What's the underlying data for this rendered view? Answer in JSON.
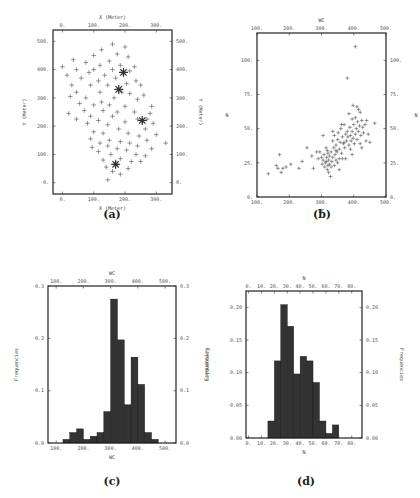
{
  "chart_data": [
    {
      "panel": "a",
      "type": "scatter",
      "caption": "(a)",
      "title": "",
      "xlabel": "X (Meter)",
      "ylabel": "Y (Meter)",
      "xticks": [
        "0.",
        "100.",
        "200.",
        "300."
      ],
      "yticks": [
        "0.",
        "100.",
        "200.",
        "300.",
        "400.",
        "500."
      ],
      "xlim": [
        -30,
        350
      ],
      "ylim": [
        -40,
        540
      ],
      "grid": false,
      "highlighted_points": [
        [
          195,
          390
        ],
        [
          180,
          330
        ],
        [
          255,
          220
        ],
        [
          170,
          65
        ]
      ],
      "points": [
        [
          160,
          490
        ],
        [
          200,
          480
        ],
        [
          125,
          470
        ],
        [
          100,
          450
        ],
        [
          175,
          455
        ],
        [
          210,
          445
        ],
        [
          35,
          435
        ],
        [
          75,
          425
        ],
        [
          150,
          430
        ],
        [
          120,
          415
        ],
        [
          185,
          415
        ],
        [
          230,
          410
        ],
        [
          0,
          410
        ],
        [
          45,
          400
        ],
        [
          100,
          400
        ],
        [
          160,
          400
        ],
        [
          215,
          395
        ],
        [
          15,
          380
        ],
        [
          85,
          390
        ],
        [
          135,
          380
        ],
        [
          60,
          370
        ],
        [
          115,
          360
        ],
        [
          170,
          370
        ],
        [
          235,
          360
        ],
        [
          30,
          345
        ],
        [
          90,
          345
        ],
        [
          145,
          345
        ],
        [
          205,
          350
        ],
        [
          250,
          345
        ],
        [
          45,
          320
        ],
        [
          120,
          320
        ],
        [
          190,
          320
        ],
        [
          215,
          315
        ],
        [
          260,
          310
        ],
        [
          25,
          305
        ],
        [
          75,
          300
        ],
        [
          165,
          300
        ],
        [
          240,
          295
        ],
        [
          125,
          285
        ],
        [
          55,
          280
        ],
        [
          100,
          275
        ],
        [
          150,
          275
        ],
        [
          200,
          270
        ],
        [
          285,
          270
        ],
        [
          70,
          255
        ],
        [
          130,
          255
        ],
        [
          175,
          250
        ],
        [
          230,
          250
        ],
        [
          280,
          245
        ],
        [
          20,
          245
        ],
        [
          90,
          235
        ],
        [
          160,
          235
        ],
        [
          270,
          225
        ],
        [
          45,
          225
        ],
        [
          115,
          220
        ],
        [
          200,
          215
        ],
        [
          240,
          225
        ],
        [
          290,
          210
        ],
        [
          80,
          210
        ],
        [
          145,
          205
        ],
        [
          180,
          190
        ],
        [
          265,
          190
        ],
        [
          100,
          180
        ],
        [
          130,
          175
        ],
        [
          210,
          175
        ],
        [
          245,
          165
        ],
        [
          300,
          170
        ],
        [
          90,
          155
        ],
        [
          150,
          150
        ],
        [
          185,
          145
        ],
        [
          270,
          150
        ],
        [
          120,
          140
        ],
        [
          215,
          140
        ],
        [
          330,
          140
        ],
        [
          145,
          130
        ],
        [
          240,
          130
        ],
        [
          95,
          125
        ],
        [
          175,
          120
        ],
        [
          205,
          115
        ],
        [
          285,
          120
        ],
        [
          115,
          110
        ],
        [
          155,
          100
        ],
        [
          235,
          100
        ],
        [
          265,
          95
        ],
        [
          185,
          85
        ],
        [
          130,
          80
        ],
        [
          220,
          75
        ],
        [
          250,
          75
        ],
        [
          140,
          55
        ],
        [
          210,
          50
        ],
        [
          160,
          40
        ],
        [
          185,
          30
        ],
        [
          145,
          10
        ]
      ]
    },
    {
      "panel": "b",
      "type": "scatter",
      "caption": "(b)",
      "title": "",
      "xlabel": "WC",
      "ylabel": "N",
      "xticks": [
        "100.",
        "200.",
        "300.",
        "400.",
        "500."
      ],
      "yticks": [
        "0.",
        "25.",
        "50.",
        "75.",
        "100."
      ],
      "xlim": [
        100,
        500
      ],
      "ylim": [
        0,
        120
      ],
      "grid": false,
      "points": [
        [
          135,
          17
        ],
        [
          165,
          21
        ],
        [
          170,
          31
        ],
        [
          160,
          23
        ],
        [
          175,
          18
        ],
        [
          180,
          21
        ],
        [
          190,
          22
        ],
        [
          205,
          24
        ],
        [
          230,
          21
        ],
        [
          240,
          26
        ],
        [
          255,
          36
        ],
        [
          270,
          30
        ],
        [
          275,
          21
        ],
        [
          285,
          33
        ],
        [
          290,
          28
        ],
        [
          295,
          33
        ],
        [
          300,
          29
        ],
        [
          302,
          24
        ],
        [
          305,
          45
        ],
        [
          305,
          27
        ],
        [
          308,
          31
        ],
        [
          310,
          22
        ],
        [
          312,
          25
        ],
        [
          314,
          36
        ],
        [
          315,
          26
        ],
        [
          316,
          29
        ],
        [
          318,
          20
        ],
        [
          320,
          23
        ],
        [
          320,
          32
        ],
        [
          322,
          18
        ],
        [
          322,
          27
        ],
        [
          325,
          24
        ],
        [
          325,
          30
        ],
        [
          328,
          15
        ],
        [
          330,
          22
        ],
        [
          330,
          33
        ],
        [
          332,
          26
        ],
        [
          335,
          41
        ],
        [
          335,
          29
        ],
        [
          338,
          36
        ],
        [
          340,
          23
        ],
        [
          340,
          45
        ],
        [
          342,
          31
        ],
        [
          345,
          27
        ],
        [
          345,
          38
        ],
        [
          348,
          33
        ],
        [
          350,
          42
        ],
        [
          350,
          25
        ],
        [
          352,
          47
        ],
        [
          355,
          35
        ],
        [
          355,
          28
        ],
        [
          358,
          40
        ],
        [
          360,
          50
        ],
        [
          362,
          32
        ],
        [
          365,
          44
        ],
        [
          365,
          28
        ],
        [
          368,
          39
        ],
        [
          370,
          53
        ],
        [
          372,
          36
        ],
        [
          375,
          46
        ],
        [
          375,
          28
        ],
        [
          378,
          41
        ],
        [
          380,
          87
        ],
        [
          380,
          48
        ],
        [
          382,
          44
        ],
        [
          385,
          61
        ],
        [
          385,
          38
        ],
        [
          388,
          51
        ],
        [
          390,
          45
        ],
        [
          390,
          35
        ],
        [
          392,
          41
        ],
        [
          395,
          48
        ],
        [
          395,
          31
        ],
        [
          398,
          67
        ],
        [
          398,
          43
        ],
        [
          400,
          53
        ],
        [
          402,
          39
        ],
        [
          405,
          110
        ],
        [
          405,
          58
        ],
        [
          405,
          46
        ],
        [
          408,
          50
        ],
        [
          410,
          66
        ],
        [
          410,
          42
        ],
        [
          412,
          55
        ],
        [
          415,
          64
        ],
        [
          415,
          48
        ],
        [
          418,
          52
        ],
        [
          420,
          39
        ],
        [
          422,
          45
        ],
        [
          425,
          56
        ],
        [
          425,
          36
        ],
        [
          428,
          51
        ],
        [
          430,
          47
        ],
        [
          435,
          53
        ],
        [
          438,
          41
        ],
        [
          440,
          56
        ],
        [
          445,
          46
        ],
        [
          450,
          40
        ],
        [
          465,
          54
        ],
        [
          370,
          40
        ],
        [
          345,
          34
        ],
        [
          335,
          48
        ],
        [
          355,
          20
        ],
        [
          318,
          34
        ],
        [
          362,
          53
        ],
        [
          395,
          57
        ],
        [
          420,
          62
        ]
      ]
    },
    {
      "panel": "c",
      "type": "bar",
      "caption": "(c)",
      "title": "",
      "xlabel": "WC",
      "ylabel": "Frequencies",
      "xticks": [
        "100.",
        "200.",
        "300.",
        "400.",
        "500."
      ],
      "yticks": [
        "0.0",
        "0.1",
        "0.2",
        "0.3"
      ],
      "xlim": [
        70,
        540
      ],
      "ylim": [
        0,
        0.3
      ],
      "bin_width": 25,
      "bin_starts": [
        125,
        150,
        175,
        200,
        225,
        250,
        275,
        300,
        325,
        350,
        375,
        400,
        425,
        450
      ],
      "values": [
        0.007,
        0.02,
        0.027,
        0.007,
        0.013,
        0.02,
        0.06,
        0.275,
        0.197,
        0.073,
        0.164,
        0.112,
        0.02,
        0.007
      ]
    },
    {
      "panel": "d",
      "type": "bar",
      "caption": "(d)",
      "title": "",
      "xlabel": "N",
      "ylabel": "Frequencies",
      "xticks": [
        "0.",
        "10.",
        "20.",
        "30.",
        "40.",
        "50.",
        "60.",
        "70.",
        "80."
      ],
      "yticks": [
        "0.00",
        "0.05",
        "0.10",
        "0.15",
        "0.20"
      ],
      "xlim": [
        -2,
        88
      ],
      "ylim": [
        0,
        0.225
      ],
      "bin_width": 5,
      "bin_starts": [
        15,
        20,
        25,
        30,
        35,
        40,
        45,
        50,
        55,
        60,
        65
      ],
      "values": [
        0.026,
        0.118,
        0.204,
        0.171,
        0.098,
        0.125,
        0.118,
        0.085,
        0.026,
        0.007,
        0.02
      ]
    }
  ],
  "captions": {
    "a": "(a)",
    "b": "(b)",
    "c": "(c)",
    "d": "(d)"
  },
  "colors": {
    "marker": "#555555",
    "bar": "#333333",
    "frame": "#222222"
  }
}
